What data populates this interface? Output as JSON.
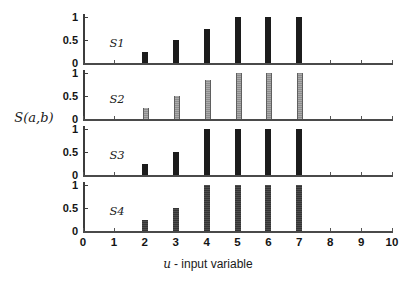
{
  "chart_data": {
    "type": "bar",
    "x": [
      2,
      3,
      4,
      5,
      6,
      7
    ],
    "series": [
      {
        "name": "S1",
        "values": [
          0.25,
          0.5,
          0.75,
          1,
          1,
          1
        ],
        "color": "#1c1c1c",
        "style": "solid",
        "bar_width_px": 6
      },
      {
        "name": "S2",
        "values": [
          0.25,
          0.5,
          0.85,
          1,
          1,
          1
        ],
        "color": "#9a9a9a",
        "style": "hatched-gray",
        "bar_width_px": 4
      },
      {
        "name": "S3",
        "values": [
          0.25,
          0.5,
          1,
          1,
          1,
          1
        ],
        "color": "#1c1c1c",
        "style": "solid",
        "bar_width_px": 6
      },
      {
        "name": "S4",
        "values": [
          0.25,
          0.5,
          1,
          1,
          1,
          1
        ],
        "color": "#3e3e3e",
        "style": "stippled-dark",
        "bar_width_px": 6
      }
    ],
    "xlabel": "u - input variable",
    "xlabel_parts": {
      "var": "u",
      "rest": "- input variable"
    },
    "ylabel": "S(a,b)",
    "xlim": [
      0,
      10
    ],
    "ylim": [
      0,
      1
    ],
    "x_tick_labels": [
      "0",
      "1",
      "2",
      "3",
      "4",
      "5",
      "6",
      "7",
      "8",
      "9",
      "10"
    ],
    "y_tick_labels_top_to_bottom": [
      "1",
      "0.5",
      "0"
    ],
    "grid": false,
    "legend_position": "none (series names printed inside each subplot)"
  },
  "colors": {
    "background": "#ffffff",
    "axis": "#4a4a4a",
    "tick_text": "#141414"
  }
}
